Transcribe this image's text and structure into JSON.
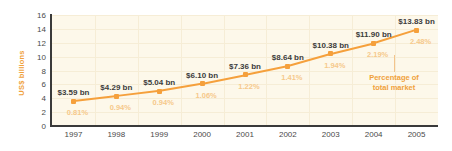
{
  "chart_data": {
    "type": "line",
    "title": "",
    "xlabel": "",
    "ylabel": "US$ billions",
    "ylim": [
      0,
      16
    ],
    "yticks": [
      "0",
      "2",
      "4",
      "6",
      "8",
      "10",
      "12",
      "14",
      "16"
    ],
    "grid": true,
    "legend_position": "none",
    "categories": [
      "1997",
      "1998",
      "1999",
      "2000",
      "2001",
      "2002",
      "2003",
      "2004",
      "2005"
    ],
    "values": [
      3.59,
      4.29,
      5.04,
      6.1,
      7.36,
      8.64,
      10.38,
      11.9,
      13.83
    ],
    "value_labels": [
      "$3.59 bn",
      "$4.29 bn",
      "$5.04 bn",
      "$6.10 bn",
      "$7.36 bn",
      "$8.64 bn",
      "$10.38 bn",
      "$11.90 bn",
      "$13.83 bn"
    ],
    "secondary_series": {
      "name": "Percentage of total market",
      "values": [
        0.81,
        0.94,
        0.94,
        1.06,
        1.22,
        1.41,
        1.94,
        2.19,
        2.48
      ],
      "labels": [
        "0.81%",
        "0.94%",
        "0.94%",
        "1.06%",
        "1.22%",
        "1.41%",
        "1.94%",
        "2.19%",
        "2.48%"
      ]
    },
    "annotations": [
      {
        "text_line1": "Percentage of",
        "text_line2": "total market"
      }
    ],
    "colors": {
      "series_line": "#F5A03C",
      "marker": "#F5A03C",
      "plot_background": "#FDF8EA",
      "gridline": "#F6EDD6",
      "axis": "#3A3A3A",
      "value_label": "#3C3C3C",
      "percent_label": "#F6C98A",
      "axis_title": "#F0A13A",
      "annotation": "#F0A13A"
    }
  }
}
